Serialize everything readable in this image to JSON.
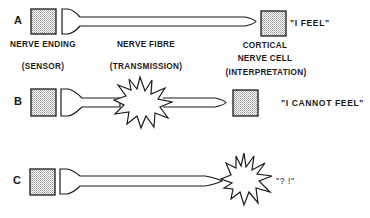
{
  "diagram": {
    "rows": [
      {
        "letter": "A",
        "scenario": "intact-pathway",
        "quote": "\"I FEEL\""
      },
      {
        "letter": "B",
        "scenario": "fibre-interrupted",
        "quote": "\"I CANNOT FEEL\""
      },
      {
        "letter": "C",
        "scenario": "cortical-disruption",
        "quote": "\"? !\""
      }
    ],
    "captions": {
      "sensor_title": "NERVE ENDING",
      "sensor_role": "(SENSOR)",
      "fibre_title": "NERVE FIBRE",
      "fibre_role": "(TRANSMISSION)",
      "cortex_title_1": "CORTICAL",
      "cortex_title_2": "NERVE CELL",
      "cortex_role": "(INTERPRETATION)"
    },
    "colors": {
      "stroke": "#1a1a1a",
      "fill_box": "#d8d8d8",
      "background": "#ffffff"
    }
  }
}
